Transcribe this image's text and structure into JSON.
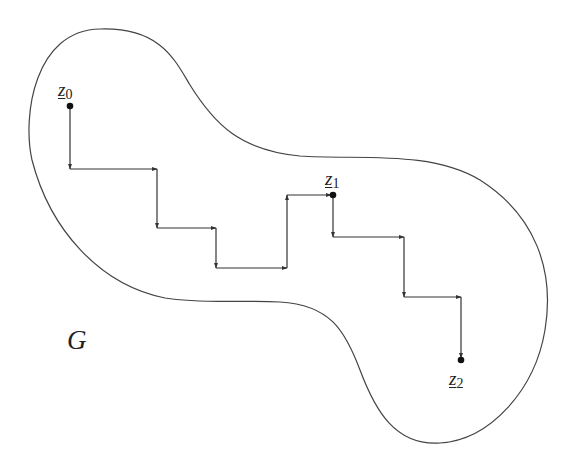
{
  "diagram": {
    "region_label": "G",
    "stroke_color": "#333333",
    "background": "#ffffff",
    "points": [
      {
        "id": "z0",
        "base": "z",
        "subscript": "0",
        "x": 70,
        "y": 106
      },
      {
        "id": "z1",
        "base": "z",
        "subscript": "1",
        "x": 333,
        "y": 195
      },
      {
        "id": "z2",
        "base": "z",
        "subscript": "2",
        "x": 461,
        "y": 360
      }
    ],
    "staircase_path": [
      [
        70,
        106
      ],
      [
        70,
        169
      ],
      [
        157,
        169
      ],
      [
        157,
        228
      ],
      [
        216,
        228
      ],
      [
        216,
        268
      ],
      [
        287,
        268
      ],
      [
        287,
        195
      ],
      [
        333,
        195
      ],
      [
        333,
        237
      ],
      [
        404,
        237
      ],
      [
        404,
        297
      ],
      [
        461,
        297
      ],
      [
        461,
        360
      ]
    ]
  }
}
